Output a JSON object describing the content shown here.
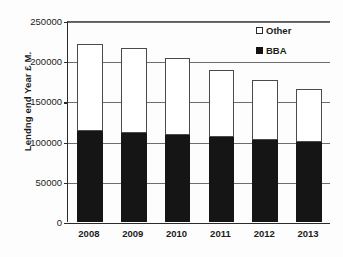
{
  "chart_data": {
    "type": "bar",
    "subtype": "stacked-column",
    "title": "",
    "xlabel": "",
    "ylabel": "Lendng end Year £ M.",
    "categories": [
      "2008",
      "2009",
      "2010",
      "2011",
      "2012",
      "2013"
    ],
    "series": [
      {
        "name": "BBA",
        "color": "#151515",
        "values": [
          113000,
          111000,
          108000,
          106000,
          102000,
          100000
        ]
      },
      {
        "name": "Other",
        "color": "#ffffff",
        "values": [
          108000,
          105000,
          96000,
          83000,
          75000,
          65000
        ]
      }
    ],
    "totals": [
      221000,
      216000,
      204000,
      189000,
      177000,
      165000
    ],
    "ylim": [
      0,
      250000
    ],
    "ytick_values": [
      0,
      50000,
      100000,
      150000,
      200000,
      250000
    ],
    "ytick_labels": [
      "0",
      "50000",
      "100000",
      "150000",
      "200000",
      "250000"
    ],
    "grid": true,
    "grid_axis": "y",
    "legend": {
      "position": "top-right",
      "entries": [
        {
          "label": "Other",
          "swatch": "open-square"
        },
        {
          "label": "BBA",
          "swatch": "filled-square"
        }
      ]
    },
    "stack_order_bottom_to_top": [
      "BBA",
      "Other"
    ]
  }
}
